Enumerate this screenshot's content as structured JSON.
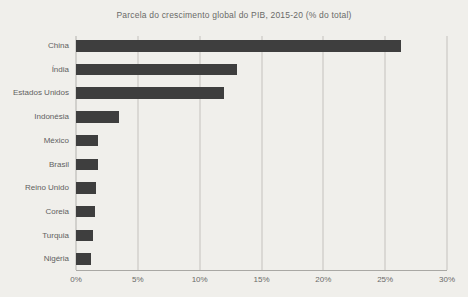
{
  "figure": {
    "background_color": "#f0efeb"
  },
  "chart_data": {
    "type": "bar",
    "orientation": "horizontal",
    "title": "Parcela do crescimento global do PIB, 2015-20 (% do total)",
    "categories": [
      "China",
      "Índia",
      "Estados Unidos",
      "Indonésia",
      "México",
      "Brasil",
      "Reino Unido",
      "Coreia",
      "Turquia",
      "Nigéria"
    ],
    "values": [
      26.3,
      13.0,
      12.0,
      3.5,
      1.8,
      1.75,
      1.6,
      1.5,
      1.4,
      1.2
    ],
    "xlabel": "",
    "ylabel": "",
    "x_ticks": [
      "0%",
      "5%",
      "10%",
      "15%",
      "20%",
      "25%",
      "30%"
    ],
    "x_tick_values": [
      0,
      5,
      10,
      15,
      20,
      25,
      30
    ],
    "xlim": [
      0,
      30
    ],
    "grid": "vertical",
    "legend": "none",
    "bar_color": "#3e3e3e",
    "gridline_color": "#c3c2be",
    "axis_color": "#a9a8a4",
    "title_color": "#6a6a68",
    "label_color": "#61615f"
  }
}
